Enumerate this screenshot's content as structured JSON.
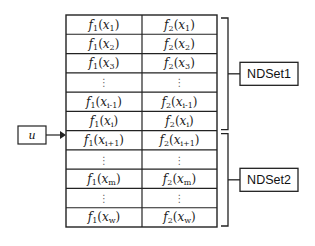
{
  "diagram": {
    "input_label": "u",
    "columns": [
      "f1",
      "f2"
    ],
    "rows": [
      {
        "c1": {
          "f": "f",
          "fsub": "1",
          "x": "x",
          "xsub": "1"
        },
        "c2": {
          "f": "f",
          "fsub": "2",
          "x": "x",
          "xsub": "1"
        }
      },
      {
        "c1": {
          "f": "f",
          "fsub": "1",
          "x": "x",
          "xsub": "2"
        },
        "c2": {
          "f": "f",
          "fsub": "2",
          "x": "x",
          "xsub": "2"
        }
      },
      {
        "c1": {
          "f": "f",
          "fsub": "1",
          "x": "x",
          "xsub": "3"
        },
        "c2": {
          "f": "f",
          "fsub": "2",
          "x": "x",
          "xsub": "3"
        }
      },
      {
        "ellipsis": true
      },
      {
        "c1": {
          "f": "f",
          "fsub": "1",
          "x": "x",
          "xsub": "i-1"
        },
        "c2": {
          "f": "f",
          "fsub": "2",
          "x": "x",
          "xsub": "i-1"
        }
      },
      {
        "c1": {
          "f": "f",
          "fsub": "1",
          "x": "x",
          "xsub": "i"
        },
        "c2": {
          "f": "f",
          "fsub": "2",
          "x": "x",
          "xsub": "i"
        }
      },
      {
        "c1": {
          "f": "f",
          "fsub": "1",
          "x": "x",
          "xsub": "i+1"
        },
        "c2": {
          "f": "f",
          "fsub": "2",
          "x": "x",
          "xsub": "i+1"
        }
      },
      {
        "ellipsis": true
      },
      {
        "c1": {
          "f": "f",
          "fsub": "1",
          "x": "x",
          "xsub": "m"
        },
        "c2": {
          "f": "f",
          "fsub": "2",
          "x": "x",
          "xsub": "m"
        }
      },
      {
        "ellipsis": true
      },
      {
        "c1": {
          "f": "f",
          "fsub": "1",
          "x": "x",
          "xsub": "w"
        },
        "c2": {
          "f": "f",
          "fsub": "2",
          "x": "x",
          "xsub": "w"
        }
      }
    ],
    "ellipsis_glyph": "⋮",
    "sets": [
      {
        "label": "NDSet1",
        "first_row": 0,
        "last_row": 5
      },
      {
        "label": "NDSet2",
        "first_row": 6,
        "last_row": 10
      }
    ],
    "arrow_target_row_boundary": 6
  }
}
